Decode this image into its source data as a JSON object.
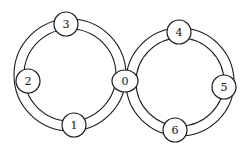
{
  "diagram": {
    "type": "figure-eight ring network",
    "colors": {
      "stroke": "#1a1a1a",
      "fill": "#ffffff",
      "text": "#111111"
    },
    "rings": [
      {
        "name": "left-ring",
        "cx": 70,
        "cy": 75,
        "outer_r": 56,
        "inner_r": 46
      },
      {
        "name": "right-ring",
        "cx": 180,
        "cy": 82,
        "outer_r": 54,
        "inner_r": 44
      }
    ],
    "nodes": [
      {
        "id": "0",
        "label": "0",
        "cx": 125,
        "cy": 81,
        "shape": "ellipse",
        "rx": 13,
        "ry": 11
      },
      {
        "id": "1",
        "label": "1",
        "cx": 74,
        "cy": 125,
        "shape": "circle",
        "r": 12
      },
      {
        "id": "2",
        "label": "2",
        "cx": 28,
        "cy": 81,
        "shape": "circle",
        "r": 12
      },
      {
        "id": "3",
        "label": "3",
        "cx": 66,
        "cy": 24,
        "shape": "circle",
        "r": 12
      },
      {
        "id": "4",
        "label": "4",
        "cx": 179,
        "cy": 32,
        "shape": "circle",
        "r": 12
      },
      {
        "id": "5",
        "label": "5",
        "cx": 224,
        "cy": 87,
        "shape": "circle",
        "r": 12
      },
      {
        "id": "6",
        "label": "6",
        "cx": 175,
        "cy": 130,
        "shape": "circle",
        "r": 12
      }
    ]
  }
}
